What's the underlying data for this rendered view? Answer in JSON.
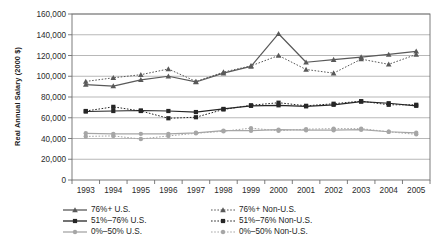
{
  "chart_data": {
    "type": "line",
    "title": "",
    "xlabel": "",
    "ylabel": "Real Annual Salary (2000 $)",
    "categories": [
      "1993",
      "1994",
      "1995",
      "1996",
      "1997",
      "1998",
      "1999",
      "2000",
      "2001",
      "2002",
      "2003",
      "2004",
      "2005"
    ],
    "ylim": [
      0,
      160000
    ],
    "ytick_values": [
      0,
      20000,
      40000,
      60000,
      80000,
      100000,
      120000,
      140000,
      160000
    ],
    "ytick_labels": [
      "0",
      "20,000",
      "40,000",
      "60,000",
      "80,000",
      "100,000",
      "120,000",
      "140,000",
      "160,000"
    ],
    "grid": true,
    "legend_position": "bottom",
    "series": [
      {
        "name": "76%+ U.S.",
        "style": "solid",
        "marker": "triangle",
        "color": "#595959",
        "values": [
          92000,
          90500,
          96500,
          100000,
          94500,
          103000,
          109500,
          141000,
          113500,
          116000,
          118500,
          121000,
          124000
        ]
      },
      {
        "name": "76%+ Non-U.S.",
        "style": "dotted",
        "marker": "triangle",
        "color": "#595959",
        "values": [
          95000,
          98500,
          101500,
          107000,
          95000,
          104000,
          110000,
          120000,
          106500,
          103000,
          116500,
          111500,
          121000
        ]
      },
      {
        "name": "51%-76% U.S.",
        "style": "solid",
        "marker": "square",
        "color": "#262626",
        "values": [
          66000,
          66500,
          67000,
          66500,
          65500,
          68500,
          71500,
          72000,
          71000,
          72500,
          75500,
          74000,
          71500
        ]
      },
      {
        "name": "51%-76% Non-U.S.",
        "style": "dotted",
        "marker": "square",
        "color": "#262626",
        "values": [
          66500,
          70500,
          66500,
          59500,
          60500,
          68000,
          72000,
          74500,
          71500,
          73500,
          76000,
          72500,
          72500
        ]
      },
      {
        "name": "0%-50% U.S.",
        "style": "solid",
        "marker": "circle",
        "color": "#a6a6a6",
        "values": [
          45000,
          44500,
          44500,
          44500,
          45500,
          47500,
          47500,
          48500,
          48000,
          48000,
          48500,
          46500,
          45500
        ]
      },
      {
        "name": "0%-50% Non-U.S.",
        "style": "dotted",
        "marker": "circle",
        "color": "#a6a6a6",
        "values": [
          42000,
          42500,
          39500,
          42500,
          45000,
          47000,
          50000,
          47500,
          49000,
          49500,
          49500,
          46500,
          44000
        ]
      }
    ]
  },
  "legend": {
    "items": [
      {
        "label": "76%+ U.S."
      },
      {
        "label": "76%+ Non-U.S."
      },
      {
        "label": "51%–76% U.S."
      },
      {
        "label": "51%–76% Non-U.S."
      },
      {
        "label": "0%–50% U.S."
      },
      {
        "label": "0%–50% Non-U.S."
      }
    ]
  },
  "axis": {
    "y_title": "Real Annual Salary (2000 $)"
  },
  "colors": {
    "series_dark": "#262626",
    "series_mid": "#595959",
    "series_light": "#a6a6a6",
    "grid": "#9a9a9a",
    "frame": "#6e6e6e",
    "background": "#ffffff"
  }
}
